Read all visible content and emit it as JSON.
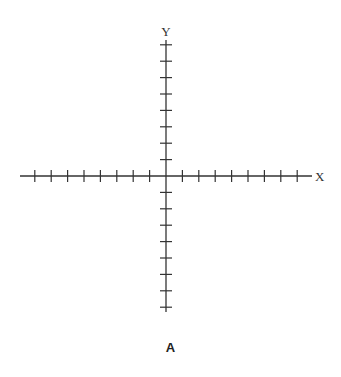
{
  "diagram": {
    "type": "cartesian-axes",
    "x_axis_label": "X",
    "y_axis_label": "Y",
    "caption": "A",
    "ticks_per_half_axis": 8,
    "origin_px": [
      166,
      176
    ],
    "tick_spacing_px": 16.4,
    "line_color": "#333333"
  }
}
